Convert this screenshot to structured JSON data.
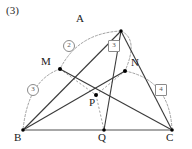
{
  "figure": {
    "problem_number": "(3)",
    "width": 192,
    "height": 149,
    "colors": {
      "solid_line": "#3a3a3a",
      "dashed_line": "#8a8a8a",
      "base_line": "#8a8a8a",
      "point_fill": "#000000",
      "label_text": "#1a1a1a",
      "ratio_text": "#555555",
      "background": "#ffffff"
    },
    "vertices": [
      {
        "id": "A",
        "label": "A",
        "x": 121,
        "y": 31,
        "label_x": 76,
        "label_y": 13
      },
      {
        "id": "M",
        "label": "M",
        "x": 60,
        "y": 69,
        "label_x": 41,
        "label_y": 56
      },
      {
        "id": "N",
        "label": "N",
        "x": 125,
        "y": 71,
        "label_x": 131,
        "label_y": 57
      },
      {
        "id": "P",
        "label": "P",
        "x": 96,
        "y": 95,
        "label_x": 89,
        "label_y": 97
      },
      {
        "id": "B",
        "label": "B",
        "x": 23,
        "y": 130,
        "label_x": 14,
        "label_y": 132
      },
      {
        "id": "Q",
        "label": "Q",
        "x": 104,
        "y": 130,
        "label_x": 98,
        "label_y": 132
      },
      {
        "id": "C",
        "label": "C",
        "x": 172,
        "y": 130,
        "label_x": 166,
        "label_y": 132
      }
    ],
    "ratio_labels": [
      {
        "id": "ratio-am",
        "text": "2",
        "shape": "circle",
        "x": 63,
        "y": 40
      },
      {
        "id": "ratio-an",
        "text": "3",
        "shape": "box",
        "x": 108,
        "y": 40
      },
      {
        "id": "ratio-mb",
        "text": "3",
        "shape": "circle",
        "x": 27,
        "y": 84
      },
      {
        "id": "ratio-nc",
        "text": "4",
        "shape": "box",
        "x": 155,
        "y": 84
      }
    ],
    "solid_segments": [
      {
        "name": "segment-a-b",
        "from": "A",
        "to": "B"
      },
      {
        "name": "segment-a-c",
        "from": "A",
        "to": "C"
      },
      {
        "name": "segment-a-q",
        "from": "A",
        "to": "Q"
      },
      {
        "name": "segment-b-n",
        "from": "B",
        "to": "N"
      },
      {
        "name": "segment-m-c",
        "from": "M",
        "to": "C"
      },
      {
        "name": "segment-b-c",
        "from": "B",
        "to": "C"
      }
    ],
    "dashed_segments": [
      {
        "name": "segment-m-p",
        "from": "M",
        "to": "P"
      },
      {
        "name": "segment-p-n",
        "from": "N",
        "to": "P"
      },
      {
        "name": "segment-p-q",
        "from": "P",
        "to": "Q"
      }
    ],
    "dashed_arcs": [
      {
        "name": "arc-a-m",
        "from": "A",
        "to": "M"
      },
      {
        "name": "arc-a-n",
        "from": "A",
        "to": "N"
      },
      {
        "name": "arc-m-b",
        "from": "M",
        "to": "B"
      },
      {
        "name": "arc-n-c",
        "from": "N",
        "to": "C"
      }
    ]
  }
}
